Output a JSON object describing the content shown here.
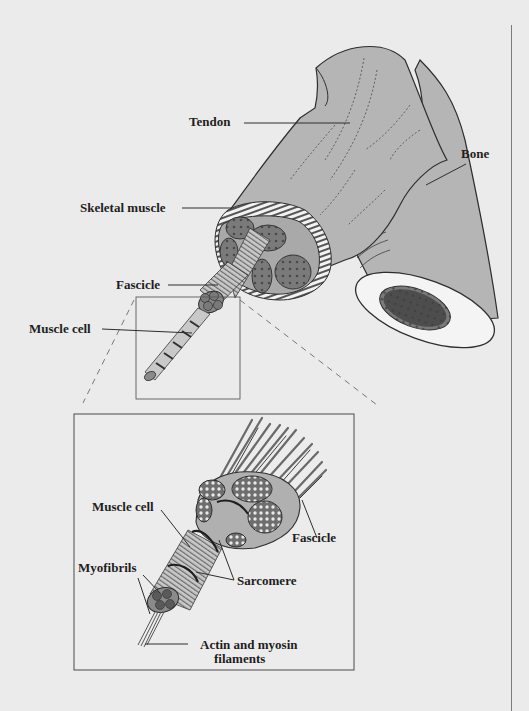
{
  "diagram": {
    "type": "anatomical-illustration",
    "colors": {
      "background": "#ebebeb",
      "tissue_fill": "#b5b5b5",
      "fascicle_fill": "#7d7d7d",
      "dark_fill": "#3a3a3a",
      "line": "#3c3c3c",
      "bone_marrow": "#3f3f3f"
    },
    "top_view": {
      "labels": {
        "tendon": "Tendon",
        "bone": "Bone",
        "skeletal_muscle": "Skeletal muscle",
        "fascicle": "Fascicle",
        "muscle_cell": "Muscle cell"
      }
    },
    "inset_view": {
      "labels": {
        "muscle_cell": "Muscle cell",
        "fascicle": "Fascicle",
        "myofibrils": "Myofibrils",
        "sarcomere": "Sarcomere",
        "actin_myosin_line1": "Actin and myosin",
        "actin_myosin_line2": "filaments"
      }
    }
  }
}
